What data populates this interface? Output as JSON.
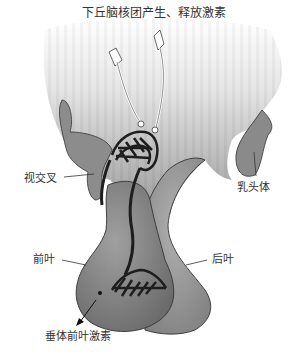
{
  "diagram": {
    "labels": {
      "top": "下丘脑核团产生、释放激素",
      "optic_chiasm": "视交叉",
      "mammillary_body": "乳头体",
      "anterior_lobe": "前叶",
      "posterior_lobe": "后叶",
      "anterior_hormones": "垂体前叶激素"
    },
    "colors": {
      "tissue_dark": "#6e6e6e",
      "tissue_mid": "#8c8c8c",
      "tissue_light": "#b5b5b5",
      "vessel": "#1e1e1e",
      "text": "#333333"
    }
  }
}
